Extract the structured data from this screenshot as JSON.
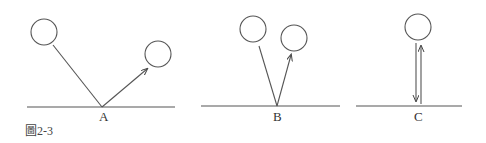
{
  "figure": {
    "caption": "圖2-3",
    "stroke_color": "#444444",
    "panels": [
      {
        "id": "A",
        "label": "A"
      },
      {
        "id": "B",
        "label": "B"
      },
      {
        "id": "C",
        "label": "C"
      }
    ]
  }
}
